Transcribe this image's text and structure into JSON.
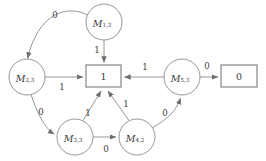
{
  "diagram": {
    "type": "finite-state-automaton-graph",
    "stroke_color": "#8a8a8a",
    "text_color": "#3a3a3a",
    "background_color": "#ffffff",
    "nodes": [
      {
        "id": "m13",
        "shape": "circle",
        "base": "M",
        "subscript": "1,3",
        "cx": 104,
        "cy": 22,
        "r": 18
      },
      {
        "id": "m23",
        "shape": "circle",
        "base": "M",
        "subscript": "2,3",
        "cx": 27,
        "cy": 77,
        "r": 18
      },
      {
        "id": "m33",
        "shape": "circle",
        "base": "M",
        "subscript": "3,3",
        "cx": 75,
        "cy": 137,
        "r": 18
      },
      {
        "id": "m42",
        "shape": "circle",
        "base": "M",
        "subscript": "4,2",
        "cx": 137,
        "cy": 137,
        "r": 18
      },
      {
        "id": "m53",
        "shape": "circle",
        "base": "M",
        "subscript": "5,3",
        "cx": 182,
        "cy": 77,
        "r": 18
      },
      {
        "id": "box1",
        "shape": "rect",
        "label": "1",
        "x": 86,
        "y": 65,
        "w": 35,
        "h": 22
      },
      {
        "id": "box0",
        "shape": "rect",
        "label": "0",
        "x": 221,
        "y": 65,
        "w": 36,
        "h": 22
      }
    ],
    "edges": [
      {
        "from": "m13",
        "to": "m23",
        "label": "0",
        "label_x": 55,
        "label_y": 15
      },
      {
        "from": "m13",
        "to": "box1",
        "label": "1",
        "label_x": 97,
        "label_y": 50
      },
      {
        "from": "m23",
        "to": "box1",
        "label": "1",
        "label_x": 62,
        "label_y": 85
      },
      {
        "from": "m23",
        "to": "m33",
        "label": "0",
        "label_x": 41,
        "label_y": 112
      },
      {
        "from": "m33",
        "to": "box1",
        "label": "1",
        "label_x": 88,
        "label_y": 113
      },
      {
        "from": "m33",
        "to": "m42",
        "label": "0",
        "label_x": 106,
        "label_y": 147
      },
      {
        "from": "m42",
        "to": "box1",
        "label": "1",
        "label_x": 126,
        "label_y": 104
      },
      {
        "from": "m42",
        "to": "m53",
        "label": "0",
        "label_x": 165,
        "label_y": 113
      },
      {
        "from": "m53",
        "to": "box1",
        "label": "1",
        "label_x": 145,
        "label_y": 68
      },
      {
        "from": "m53",
        "to": "box0",
        "label": "0",
        "label_x": 206,
        "label_y": 67
      }
    ]
  }
}
